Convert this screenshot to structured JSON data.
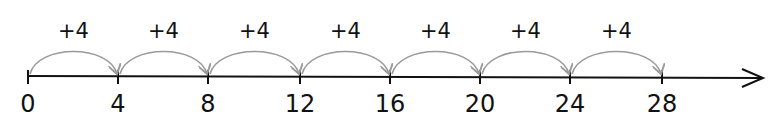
{
  "number_line": {
    "start": 0,
    "end": 28,
    "step": 4,
    "ticks": [
      "0",
      "4",
      "8",
      "12",
      "16",
      "20",
      "24",
      "28"
    ],
    "jumps": [
      "+4",
      "+4",
      "+4",
      "+4",
      "+4",
      "+4",
      "+4"
    ],
    "colors": {
      "axis": "#111111",
      "arc": "#9a9a9a",
      "text": "#111111"
    }
  }
}
